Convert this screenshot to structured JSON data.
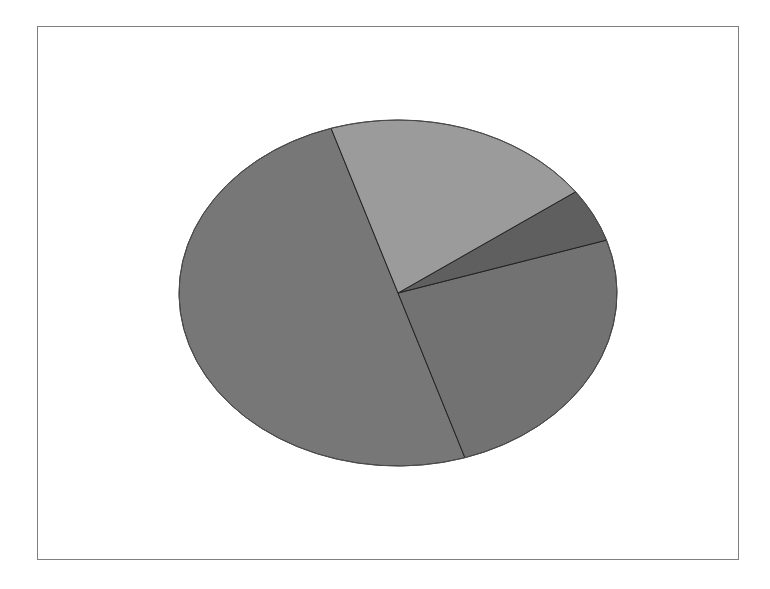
{
  "chart_data": {
    "type": "pie",
    "title": "",
    "categories": [
      "Slice A",
      "Slice B",
      "Slice C",
      "Slice D"
    ],
    "values": [
      50,
      25,
      5,
      20
    ],
    "colors": [
      "#777777",
      "#727272",
      "#5f5f5f",
      "#9b9b9b"
    ],
    "start_angle_deg": 107.8,
    "direction": "counterclockwise-from-top-left",
    "legend": "none",
    "data_labels": "none"
  },
  "geometry": {
    "cx": 398,
    "cy": 293,
    "rx": 219,
    "ry": 173
  },
  "style": {
    "frame_border": "#7f7f7f",
    "slice_stroke": "#222222"
  }
}
